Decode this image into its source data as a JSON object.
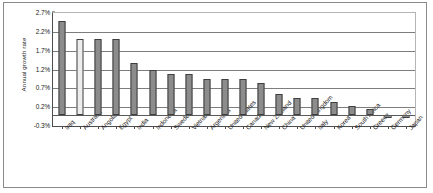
{
  "chart_data": {
    "type": "bar",
    "title": "",
    "subtitle": "",
    "xlabel": "",
    "ylabel": "Annual growth rate",
    "ylim": [
      -0.3,
      2.7
    ],
    "ytick_labels": [
      "2.7%",
      "2.2%",
      "1.7%",
      "1.2%",
      "0.7%",
      "0.2%",
      "-0.3%"
    ],
    "ytick_values": [
      2.7,
      2.2,
      1.7,
      1.2,
      0.7,
      0.2,
      -0.3
    ],
    "grid": true,
    "legend": "none",
    "value_unit": "percent",
    "highlighted_category": "Australia",
    "categories": [
      "Iraq",
      "Australia",
      "Angola",
      "Egypt",
      "India",
      "Indonesia",
      "Sweden",
      "Vietnam",
      "Argentina",
      "United States",
      "Canada",
      "New Zealand",
      "China",
      "United Kingdom",
      "Italy",
      "Korea",
      "South Africa",
      "Greece",
      "Germany",
      "Japan"
    ],
    "values": [
      2.5,
      2.0,
      2.0,
      2.0,
      1.37,
      1.19,
      1.08,
      1.08,
      0.96,
      0.96,
      0.96,
      0.85,
      0.56,
      0.44,
      0.44,
      0.35,
      0.24,
      0.16,
      -0.08,
      -0.09
    ]
  },
  "colors": {
    "bar_fill": "#8c8c8c",
    "bar_highlight_fill": "#ededed",
    "bar_border": "#3f3f3f",
    "gridline": "#7d7d7d",
    "axis": "#4d4d4d",
    "frame": "#8a8a8a",
    "text": "#1a1a1a",
    "background": "#ffffff"
  }
}
